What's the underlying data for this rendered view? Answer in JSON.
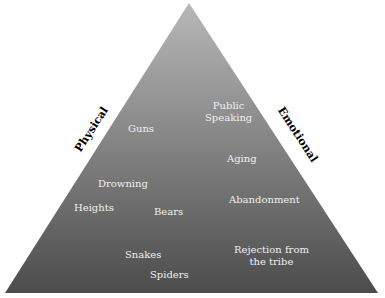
{
  "diagram": {
    "shape": "triangle",
    "colors": {
      "top": "#b4b4b4",
      "bottom": "#4f4f4f",
      "label": "#f0f0f0",
      "side_label": "#000000"
    },
    "side_labels": {
      "left": "Physical",
      "right": "Emotional"
    },
    "physical_fears": [
      "Guns",
      "Drowning",
      "Heights",
      "Bears",
      "Snakes",
      "Spiders"
    ],
    "emotional_fears": [
      "Public Speaking",
      "Aging",
      "Abandonment",
      "Rejection from the tribe"
    ],
    "labels": {
      "guns": "Guns",
      "public_speaking_1": "Public",
      "public_speaking_2": "Speaking",
      "aging": "Aging",
      "drowning": "Drowning",
      "heights": "Heights",
      "bears": "Bears",
      "abandonment": "Abandonment",
      "snakes": "Snakes",
      "rejection_1": "Rejection from",
      "rejection_2": "the tribe",
      "spiders": "Spiders"
    }
  }
}
